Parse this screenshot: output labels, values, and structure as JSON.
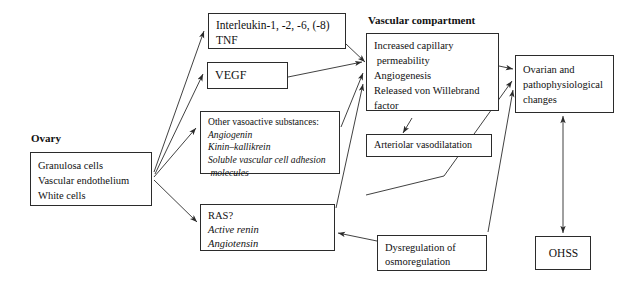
{
  "diagram": {
    "captions": {
      "ovary": "Ovary",
      "vascular_compartment": "Vascular compartment"
    },
    "nodes": {
      "interleukin": {
        "lines": [
          {
            "text": "Interleukin-1, -2, -6, (-8)",
            "style": "roman"
          },
          {
            "text": "TNF",
            "style": "roman"
          }
        ]
      },
      "vegf": {
        "lines": [
          {
            "text": "VEGF",
            "style": "roman"
          }
        ]
      },
      "vasoactive": {
        "lines": [
          {
            "text": "Other vasoactive substances:",
            "style": "roman"
          },
          {
            "text": "Angiogenin",
            "style": "italic"
          },
          {
            "text": "Kinin–kallikrein",
            "style": "italic"
          },
          {
            "text": "Soluble vascular cell adhesion",
            "style": "italic"
          },
          {
            "text": " molecules",
            "style": "italic"
          }
        ]
      },
      "ras": {
        "lines": [
          {
            "text": "RAS?",
            "style": "roman"
          },
          {
            "text": "Active renin",
            "style": "italic"
          },
          {
            "text": "Angiotensin",
            "style": "italic"
          }
        ]
      },
      "ovary": {
        "lines": [
          {
            "text": "Granulosa cells",
            "style": "roman"
          },
          {
            "text": "Vascular endothelium",
            "style": "roman"
          },
          {
            "text": "White cells",
            "style": "roman"
          }
        ]
      },
      "vascular": {
        "lines": [
          {
            "text": "Increased capillary",
            "style": "roman"
          },
          {
            "text": " permeability",
            "style": "roman"
          },
          {
            "text": "Angiogenesis",
            "style": "roman"
          },
          {
            "text": "Released von Willebrand",
            "style": "roman"
          },
          {
            "text": "factor",
            "style": "roman"
          }
        ]
      },
      "arteriolar": {
        "lines": [
          {
            "text": "Arteriolar vasodilatation",
            "style": "roman"
          }
        ]
      },
      "ovarian_changes": {
        "lines": [
          {
            "text": "Ovarian and",
            "style": "roman"
          },
          {
            "text": "pathophysiological",
            "style": "roman"
          },
          {
            "text": "changes",
            "style": "roman"
          }
        ]
      },
      "dysregulation": {
        "lines": [
          {
            "text": "Dysregulation of",
            "style": "roman"
          },
          {
            "text": "osmoregulation",
            "style": "roman"
          }
        ]
      },
      "ohss": {
        "lines": [
          {
            "text": "OHSS",
            "style": "roman"
          }
        ]
      }
    },
    "colors": {
      "stroke": "#2b2b2b",
      "background": "#ffffff",
      "text": "#111111"
    },
    "edges": [
      {
        "from": "ovary",
        "to": "interleukin",
        "arrow": "single"
      },
      {
        "from": "ovary",
        "to": "vegf",
        "arrow": "single"
      },
      {
        "from": "ovary",
        "to": "vasoactive",
        "arrow": "single"
      },
      {
        "from": "ovary",
        "to": "ras",
        "arrow": "single"
      },
      {
        "from": "interleukin",
        "to": "vascular",
        "arrow": "single"
      },
      {
        "from": "vegf",
        "to": "vascular",
        "arrow": "single"
      },
      {
        "from": "vasoactive",
        "to": "vascular",
        "arrow": "single"
      },
      {
        "from": "ras",
        "to": "vascular",
        "arrow": "single"
      },
      {
        "from": "dysregulation",
        "to": "ras",
        "arrow": "single"
      },
      {
        "from": "vascular",
        "to": "arteriolar",
        "arrow": "single"
      },
      {
        "from": "vascular",
        "to": "ovarian_changes",
        "arrow": "single"
      },
      {
        "from": "arteriolar",
        "to": "ovarian_changes",
        "arrow": "single"
      },
      {
        "from": "dysregulation",
        "to": "ovarian_changes",
        "arrow": "single"
      },
      {
        "from": "ovarian_changes",
        "to": "ohss",
        "arrow": "double"
      }
    ]
  }
}
